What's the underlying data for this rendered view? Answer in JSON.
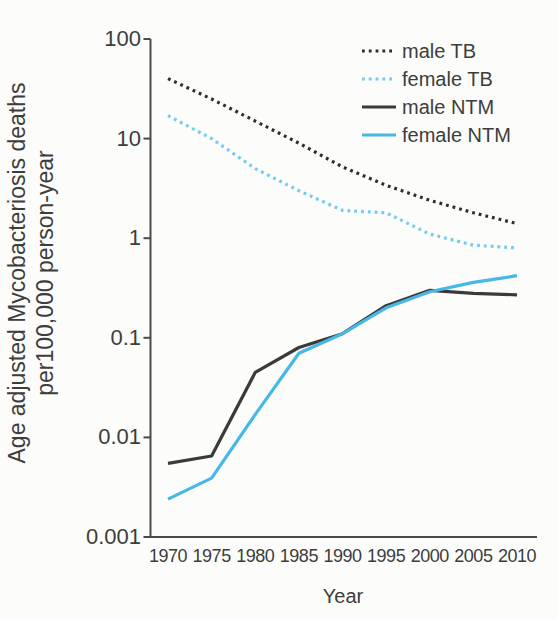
{
  "chart_data": {
    "type": "line",
    "title": "",
    "xlabel": "Year",
    "ylabel_line1": "Age adjusted Mycobacteriosis deaths",
    "ylabel_line2": "per100,000 person-year",
    "y_scale": "log",
    "grid": false,
    "legend_position": "top-right",
    "ylim": [
      0.001,
      100
    ],
    "y_ticks": [
      100,
      10,
      1,
      0.1,
      0.01,
      0.001
    ],
    "y_tick_labels": [
      "100",
      "10",
      "1",
      "0.1",
      "0.01",
      "0.001"
    ],
    "x": [
      1970,
      1975,
      1980,
      1985,
      1990,
      1995,
      2000,
      2005,
      2010
    ],
    "x_tick_labels": [
      "1970",
      "1975",
      "1980",
      "1985",
      "1990",
      "1995",
      "2000",
      "2005",
      "2010"
    ],
    "series": [
      {
        "name": "male TB",
        "style": "dotted",
        "color": "#2e2e2e",
        "values": [
          40,
          25,
          15,
          9,
          5.2,
          3.4,
          2.4,
          1.8,
          1.4
        ]
      },
      {
        "name": "female TB",
        "style": "dotted",
        "color": "#72cbf0",
        "values": [
          17,
          10,
          5,
          3.0,
          1.9,
          1.8,
          1.1,
          0.85,
          0.8
        ]
      },
      {
        "name": "male NTM",
        "style": "solid",
        "color": "#3a3a3a",
        "values": [
          0.0055,
          0.0065,
          0.045,
          0.08,
          0.11,
          0.21,
          0.3,
          0.28,
          0.27
        ]
      },
      {
        "name": "female NTM",
        "style": "solid",
        "color": "#45b8e8",
        "values": [
          0.0024,
          0.0039,
          0.017,
          0.07,
          0.11,
          0.2,
          0.29,
          0.36,
          0.42
        ]
      }
    ]
  }
}
